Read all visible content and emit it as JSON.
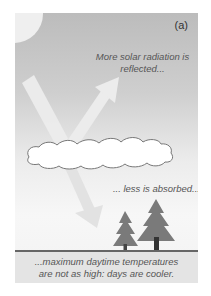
{
  "figure": {
    "panel_label": "(a)",
    "captions": {
      "reflected": "More solar radiation is reflected...",
      "absorbed": "... less is absorbed...",
      "ground_line1": "...maximum daytime temperatures",
      "ground_line2": "are not as high: days are cooler."
    },
    "elements": {
      "sun": "sun-icon",
      "cloud": "cloud-icon",
      "incoming_arrow": "incoming-radiation-arrow",
      "reflected_arrow": "reflected-radiation-arrow",
      "transmitted_arrow": "transmitted-radiation-arrow",
      "trees": [
        "small-tree-icon",
        "large-tree-icon"
      ]
    },
    "colors": {
      "sky_top": "#bcbcbc",
      "sky_bottom": "#f5f5f5",
      "arrow": "#e8e8e8",
      "tree": "#777777",
      "ground_box": "#e4e4e4",
      "ground_line": "#666666",
      "text": "#555555"
    }
  }
}
